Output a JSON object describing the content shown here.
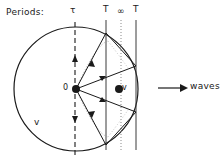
{
  "figure": {
    "caption_label": "Periods:",
    "period_marks": [
      {
        "name": "tau",
        "symbol": "τ",
        "x": 75,
        "style": "dashed"
      },
      {
        "name": "T-first",
        "symbol": "T",
        "x": 106,
        "style": "solid"
      },
      {
        "name": "infinity",
        "symbol": "∞",
        "x": 121,
        "style": "dotted"
      },
      {
        "name": "T-second",
        "symbol": "T",
        "x": 136,
        "style": "solid"
      }
    ],
    "origin_label": "0",
    "moving_point_label": "v",
    "circle_velocity_label": "v",
    "waves_label": "waves",
    "colors": {
      "ink": "#1a1a1a",
      "background": "#ffffff"
    },
    "geometry": {
      "circle_center_x": 76,
      "circle_center_y": 89,
      "circle_radius": 62,
      "moving_point_x": 119,
      "moving_point_y": 89
    }
  }
}
